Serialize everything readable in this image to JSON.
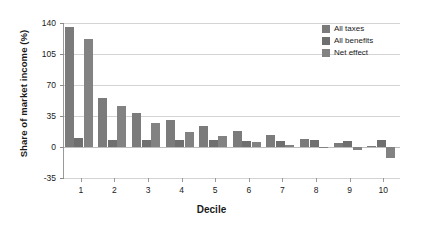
{
  "chart_data": {
    "type": "bar",
    "title": "",
    "subtitle": "",
    "xlabel": "Decile",
    "ylabel": "Share of market income (%)",
    "categories": [
      "1",
      "2",
      "3",
      "4",
      "5",
      "6",
      "7",
      "8",
      "9",
      "10"
    ],
    "ylim": [
      -35,
      140
    ],
    "yticks": [
      140,
      105,
      70,
      35,
      0,
      -35
    ],
    "ytick_labels": [
      "140",
      "105",
      "70",
      "35",
      "0",
      "-35"
    ],
    "grid": true,
    "grid_axis": "y",
    "legend_position": "top-right",
    "bar_orientation": "vertical",
    "series": [
      {
        "name": "All taxes",
        "color": "#7b7b7b",
        "values": [
          135,
          55,
          38,
          31,
          24,
          18,
          13,
          9,
          4,
          1
        ]
      },
      {
        "name": "All benefits",
        "color": "#6f6f6f",
        "values": [
          10,
          8,
          8,
          8,
          8,
          7,
          7,
          8,
          7,
          8
        ]
      },
      {
        "name": "Net effect",
        "color": "#828282",
        "values": [
          122,
          46,
          27,
          17,
          12,
          6,
          2,
          -1,
          -3,
          -12
        ]
      }
    ]
  },
  "legend": {
    "items": [
      {
        "label": "All taxes"
      },
      {
        "label": "All benefits"
      },
      {
        "label": "Net effect"
      }
    ]
  },
  "axes": {
    "y_title": "Share of market income (%)",
    "x_title": "Decile"
  }
}
